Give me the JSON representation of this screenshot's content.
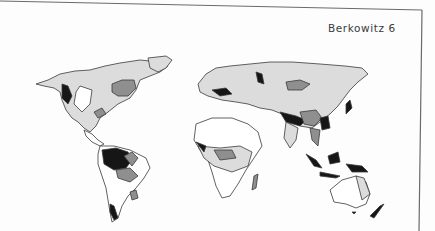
{
  "page": {
    "running_header": "Berkowitz 6",
    "figure": {
      "type": "world-map",
      "shading_levels": [
        "white",
        "light-gray",
        "medium-gray",
        "black"
      ],
      "colors": {
        "outline": "#3a3a3a",
        "light": "#d9d9d9",
        "medium": "#8f8f8f",
        "dark": "#161616",
        "paper": "#fdfdfd"
      }
    }
  }
}
